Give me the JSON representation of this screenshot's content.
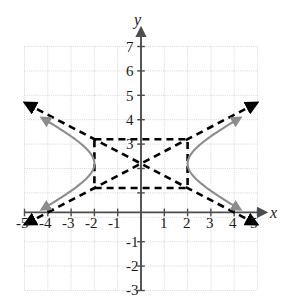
{
  "figure": {
    "kind": "coordinate-graph",
    "background_color": "#ffffff"
  },
  "axes": {
    "x_label": "x",
    "y_label": "y",
    "x_tick_labels": [
      "-5",
      "-4",
      "-3",
      "-2",
      "-1",
      "1",
      "2",
      "3",
      "4",
      "5"
    ],
    "y_tick_labels": [
      "7",
      "6",
      "5",
      "4",
      "3",
      "-1",
      "-2",
      "-3"
    ],
    "axis_color": "#4d4d4d",
    "grid_color": "#c8c8c8"
  },
  "chart_data": {
    "type": "line",
    "title": "",
    "xlabel": "x",
    "ylabel": "y",
    "xlim": [
      -5,
      5
    ],
    "ylim": [
      -3,
      7
    ],
    "grid": true,
    "legend": "none",
    "x_ticks": [
      -5,
      -4,
      -3,
      -2,
      -1,
      1,
      2,
      3,
      4,
      5
    ],
    "y_ticks": [
      7,
      6,
      5,
      4,
      3,
      -1,
      -2,
      -3
    ],
    "curve_color": "#8c8c8c",
    "asymptote_color": "#000000",
    "hyperbola": {
      "center": [
        0,
        2
      ],
      "a": 2,
      "b": 1,
      "orientation": "horizontal",
      "equation": "x^2/4 - (y-2)^2/1 = 1",
      "vertices": [
        [
          -2,
          2
        ],
        [
          2,
          2
        ]
      ]
    },
    "reference_rectangle": {
      "x_range": [
        -2,
        2
      ],
      "y_range": [
        1,
        3
      ],
      "corners": [
        [
          -2,
          1
        ],
        [
          2,
          1
        ],
        [
          2,
          3
        ],
        [
          -2,
          3
        ]
      ],
      "style": "dashed"
    },
    "asymptotes": [
      {
        "slope": 0.5,
        "intercept": 2,
        "equation": "y = 2 + x/2",
        "style": "dashed",
        "arrows": "both"
      },
      {
        "slope": -0.5,
        "intercept": 2,
        "equation": "y = 2 - x/2",
        "style": "dashed",
        "arrows": "both"
      }
    ],
    "series": [
      {
        "name": "left-branch",
        "x": [
          -5.0,
          -4.6,
          -4.2,
          -3.8,
          -3.4,
          -3.0,
          -2.8,
          -2.6,
          -2.4,
          -2.2,
          -2.1,
          -2.0,
          -2.1,
          -2.2,
          -2.4,
          -2.6,
          -2.8,
          -3.0,
          -3.4,
          -3.8,
          -4.2,
          -4.6,
          -5.0
        ],
        "y": [
          -0.29,
          0.1,
          0.31,
          0.38,
          0.62,
          0.76,
          0.92,
          1.17,
          0.66,
          1.08,
          1.69,
          2.0,
          2.31,
          2.92,
          3.34,
          3.66,
          3.96,
          4.24,
          4.75,
          5.23,
          5.69,
          6.14,
          6.29
        ]
      },
      {
        "name": "right-branch",
        "x": [
          5.0,
          4.6,
          4.2,
          3.8,
          3.4,
          3.0,
          2.8,
          2.6,
          2.4,
          2.2,
          2.1,
          2.0,
          2.1,
          2.2,
          2.4,
          2.6,
          2.8,
          3.0,
          3.4,
          3.8,
          4.2,
          4.6,
          5.0
        ],
        "y": [
          -0.29,
          0.1,
          0.31,
          0.38,
          0.62,
          0.76,
          0.92,
          1.17,
          0.66,
          1.08,
          1.69,
          2.0,
          2.31,
          2.92,
          3.34,
          3.66,
          3.96,
          4.24,
          4.75,
          5.23,
          5.69,
          6.14,
          6.29
        ]
      }
    ]
  }
}
